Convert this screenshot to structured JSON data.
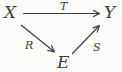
{
  "colors": {
    "ink": "#3d3d3d",
    "background": "#fbfbf9"
  },
  "diagram": {
    "type": "commutative-diagram",
    "nodes": [
      {
        "id": "X",
        "label": "X",
        "position": "top-left"
      },
      {
        "id": "Y",
        "label": "Y",
        "position": "top-right"
      },
      {
        "id": "E",
        "label": "E",
        "position": "bottom-center"
      }
    ],
    "arrows": [
      {
        "from": "X",
        "to": "Y",
        "label": "T",
        "style": "horizontal"
      },
      {
        "from": "X",
        "to": "E",
        "label": "R",
        "style": "diagonal-down"
      },
      {
        "from": "E",
        "to": "Y",
        "label": "S",
        "style": "diagonal-up"
      }
    ]
  }
}
